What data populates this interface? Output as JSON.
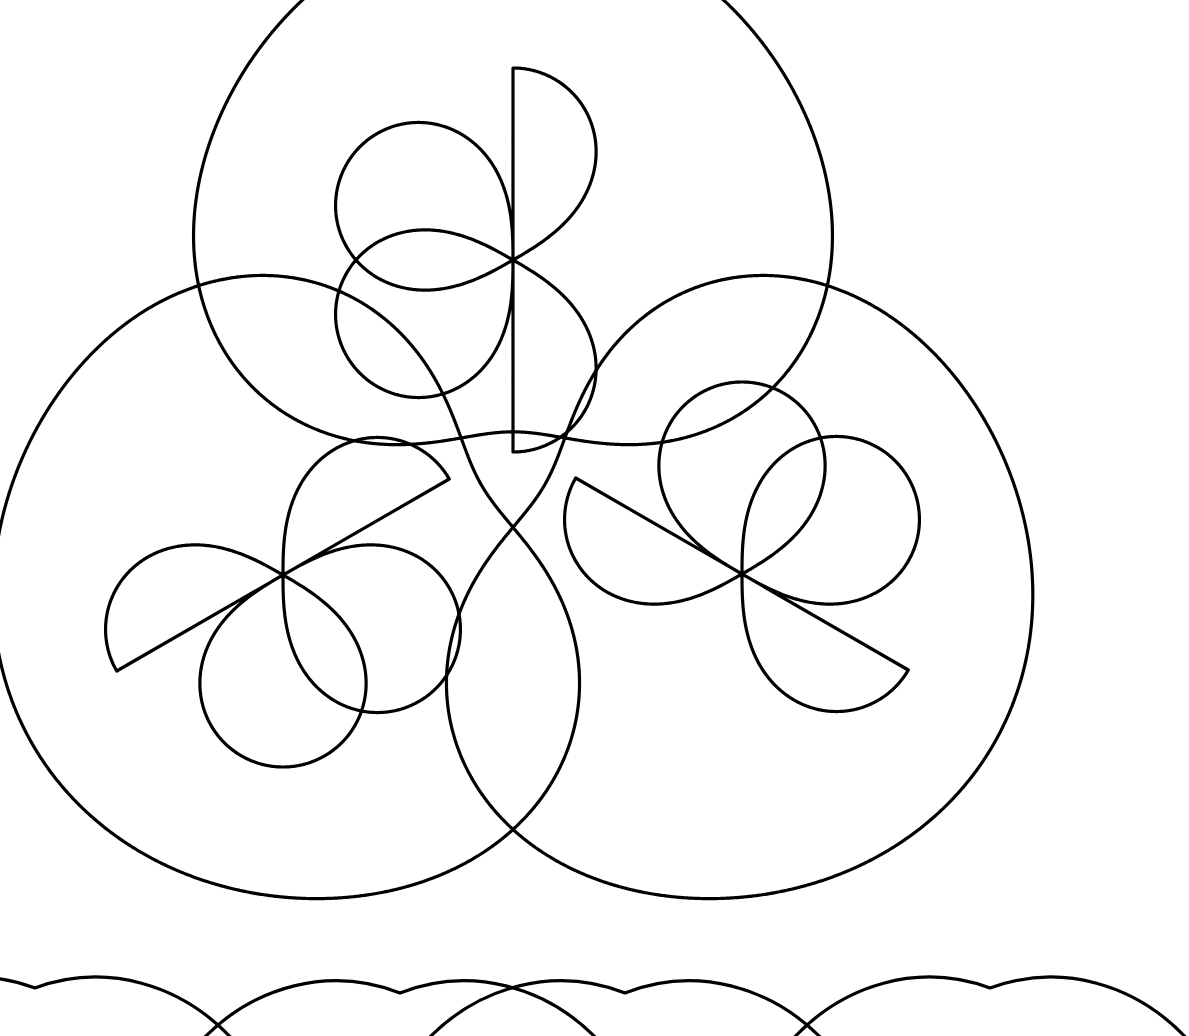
{
  "canvas": {
    "width": 1189,
    "height": 1036,
    "background_color": "#ffffff",
    "stroke_color": "#000000",
    "stroke_width": 3.2,
    "description": "Black line-art rosette pattern on white background"
  },
  "artwork": {
    "title": "Trefoil Rosette Tiling",
    "style": "continuous-line geometric rosette",
    "motif_count_full": 3,
    "motif_count_partial": 4,
    "symmetry": "3-fold rotational (120 degrees)",
    "arrangement_center": {
      "x": 512,
      "y": 466
    }
  },
  "chart_data": {
    "type": "line",
    "xlabel": "",
    "ylabel": "",
    "xlim": [
      0,
      1189
    ],
    "ylim": [
      0,
      1036
    ],
    "grid": false,
    "legend": "none",
    "curve_family": "polar rose r = a*cos(3*theta) with rounded outer lobe r = b*(1 + c*cos(3*theta))",
    "series": [
      {
        "name": "motif-top",
        "role": "outer-lobe",
        "center": {
          "x": 513,
          "y": 272
        },
        "rotation_deg": -90,
        "outer_radius": 288,
        "outer_bulge": 0.3,
        "petal_count": 3
      },
      {
        "name": "motif-top",
        "role": "inner-trefoil",
        "center": {
          "x": 513,
          "y": 260
        },
        "rotation_deg": -90,
        "petal_length": 192,
        "petal_width": 0.42,
        "petal_count": 3
      },
      {
        "name": "motif-left",
        "role": "outer-lobe",
        "center": {
          "x": 343,
          "y": 565
        },
        "rotation_deg": 150,
        "outer_radius": 288,
        "outer_bulge": 0.3,
        "petal_count": 3
      },
      {
        "name": "motif-left",
        "role": "inner-trefoil",
        "center": {
          "x": 283,
          "y": 575
        },
        "rotation_deg": 150,
        "petal_length": 192,
        "petal_width": 0.42,
        "petal_count": 3
      },
      {
        "name": "motif-right",
        "role": "outer-lobe",
        "center": {
          "x": 683,
          "y": 565
        },
        "rotation_deg": 30,
        "outer_radius": 288,
        "outer_bulge": 0.3,
        "petal_count": 3
      },
      {
        "name": "motif-right",
        "role": "inner-trefoil",
        "center": {
          "x": 742,
          "y": 574
        },
        "rotation_deg": 30,
        "petal_length": 192,
        "petal_width": 0.42,
        "petal_count": 3
      }
    ],
    "bottom_row_partial": {
      "note": "tops of a second row of motifs cropped by the bottom edge",
      "arc_apexes": [
        {
          "x": 35,
          "y": 988
        },
        {
          "x": 400,
          "y": 993
        },
        {
          "x": 625,
          "y": 993
        },
        {
          "x": 990,
          "y": 988
        }
      ]
    },
    "key_intersections": [
      {
        "name": "top-bottom-cusp",
        "x": 512,
        "y": 404
      },
      {
        "name": "lower-lobes-upper-crossing",
        "x": 512,
        "y": 610
      },
      {
        "name": "lower-lobes-lower-crossing",
        "x": 512,
        "y": 762
      }
    ],
    "extents": {
      "leftmost_x": 11,
      "rightmost_x": 1013,
      "topmost_y": 2,
      "bottom_of_lower_lobes_y": 862
    }
  },
  "layers": [
    {
      "id": "motif-top",
      "label": "Top motif"
    },
    {
      "id": "motif-left",
      "label": "Lower-left motif"
    },
    {
      "id": "motif-right",
      "label": "Lower-right motif"
    },
    {
      "id": "bottom-row",
      "label": "Bottom row partial arcs"
    }
  ]
}
